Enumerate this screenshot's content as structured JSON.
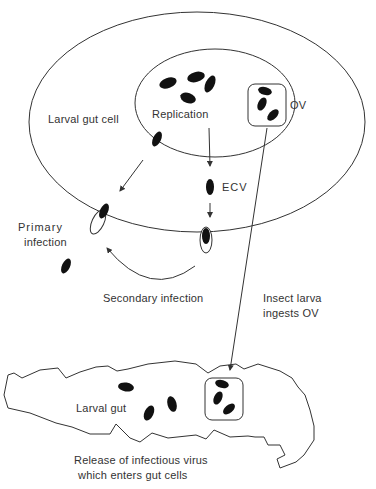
{
  "diagram": {
    "labels": {
      "larval_gut_cell": "Larval gut cell",
      "replication": "Replication",
      "ov": "OV",
      "ecv": "ECV",
      "primary_infection_1": "Primary",
      "primary_infection_2": "infection",
      "secondary_infection": "Secondary infection",
      "ingests_1": "Insect larva",
      "ingests_2": "ingests OV",
      "larval_gut": "Larval gut",
      "release_1": "Release of infectious virus",
      "release_2": "which enters gut cells"
    },
    "colors": {
      "stroke": "#333333",
      "virion": "#111111",
      "background": "#ffffff"
    }
  }
}
